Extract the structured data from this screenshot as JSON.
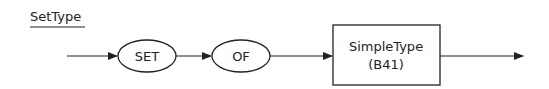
{
  "diagram": {
    "title": "SetType",
    "nodes": [
      {
        "id": "set",
        "shape": "ellipse",
        "label": "SET"
      },
      {
        "id": "of",
        "shape": "ellipse",
        "label": "OF"
      },
      {
        "id": "simpletype",
        "shape": "rectangle",
        "label_line1": "SimpleType",
        "label_line2": "(B41)"
      }
    ],
    "edges": [
      {
        "from": "start",
        "to": "set"
      },
      {
        "from": "set",
        "to": "of"
      },
      {
        "from": "of",
        "to": "simpletype"
      },
      {
        "from": "simpletype",
        "to": "end"
      }
    ],
    "colors": {
      "stroke": "#222222",
      "background": "#ffffff"
    }
  }
}
